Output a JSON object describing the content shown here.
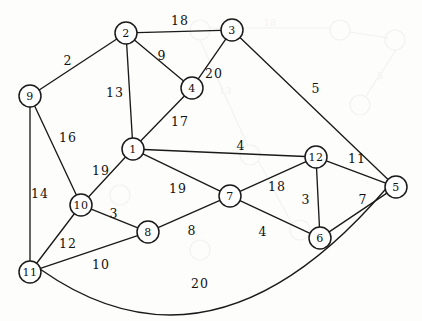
{
  "diagram": {
    "type": "weighted-undirected-graph",
    "node_radius": 11,
    "nodes": [
      {
        "id": "1",
        "label": "1",
        "x": 133,
        "y": 149
      },
      {
        "id": "2",
        "label": "2",
        "x": 126,
        "y": 33
      },
      {
        "id": "3",
        "label": "3",
        "x": 232,
        "y": 30
      },
      {
        "id": "4",
        "label": "4",
        "x": 192,
        "y": 88
      },
      {
        "id": "5",
        "label": "5",
        "x": 396,
        "y": 187
      },
      {
        "id": "6",
        "label": "6",
        "x": 320,
        "y": 238
      },
      {
        "id": "7",
        "label": "7",
        "x": 230,
        "y": 196
      },
      {
        "id": "8",
        "label": "8",
        "x": 148,
        "y": 232
      },
      {
        "id": "9",
        "label": "9",
        "x": 30,
        "y": 96
      },
      {
        "id": "10",
        "label": "10",
        "x": 81,
        "y": 205
      },
      {
        "id": "11",
        "label": "11",
        "x": 30,
        "y": 272
      },
      {
        "id": "12",
        "label": "12",
        "x": 316,
        "y": 157
      }
    ],
    "edges": [
      {
        "from": "2",
        "to": "3",
        "weight": "18",
        "lx": 180,
        "ly": 20,
        "curved": false
      },
      {
        "from": "9",
        "to": "2",
        "weight": "2",
        "lx": 68,
        "ly": 60,
        "curved": false
      },
      {
        "from": "2",
        "to": "4",
        "weight": "9",
        "lx": 162,
        "ly": 55,
        "curved": false
      },
      {
        "from": "3",
        "to": "4",
        "weight": "20",
        "lx": 214,
        "ly": 73,
        "curved": false
      },
      {
        "from": "2",
        "to": "1",
        "weight": "13",
        "lx": 115,
        "ly": 92,
        "curved": false
      },
      {
        "from": "4",
        "to": "1",
        "weight": "17",
        "lx": 180,
        "ly": 121,
        "curved": false
      },
      {
        "from": "3",
        "to": "5",
        "weight": "5",
        "lx": 316,
        "ly": 88,
        "curved": false
      },
      {
        "from": "9",
        "to": "10",
        "weight": "16",
        "lx": 68,
        "ly": 137,
        "curved": false
      },
      {
        "from": "9",
        "to": "11",
        "weight": "14",
        "lx": 40,
        "ly": 193,
        "curved": false
      },
      {
        "from": "1",
        "to": "10",
        "weight": "19",
        "lx": 101,
        "ly": 170,
        "curved": false
      },
      {
        "from": "1",
        "to": "12",
        "weight": "4",
        "lx": 241,
        "ly": 145,
        "curved": false
      },
      {
        "from": "1",
        "to": "7",
        "weight": "19",
        "lx": 178,
        "ly": 188,
        "curved": false
      },
      {
        "from": "10",
        "to": "8",
        "weight": "3",
        "lx": 114,
        "ly": 213,
        "curved": false
      },
      {
        "from": "10",
        "to": "11",
        "weight": "12",
        "lx": 68,
        "ly": 243,
        "curved": false
      },
      {
        "from": "8",
        "to": "7",
        "weight": "8",
        "lx": 192,
        "ly": 230,
        "curved": false
      },
      {
        "from": "11",
        "to": "8",
        "weight": "10",
        "lx": 101,
        "ly": 264,
        "curved": false
      },
      {
        "from": "7",
        "to": "12",
        "weight": "18",
        "lx": 277,
        "ly": 186,
        "curved": false
      },
      {
        "from": "7",
        "to": "6",
        "weight": "4",
        "lx": 263,
        "ly": 231,
        "curved": false
      },
      {
        "from": "12",
        "to": "6",
        "weight": "3",
        "lx": 306,
        "ly": 199,
        "curved": false
      },
      {
        "from": "12",
        "to": "5",
        "weight": "11",
        "lx": 357,
        "ly": 158,
        "curved": false
      },
      {
        "from": "6",
        "to": "5",
        "weight": "7",
        "lx": 363,
        "ly": 199,
        "curved": false
      },
      {
        "from": "11",
        "to": "5",
        "weight": "20",
        "lx": 200,
        "ly": 283,
        "curved": true,
        "sweep_y": 310
      }
    ]
  }
}
